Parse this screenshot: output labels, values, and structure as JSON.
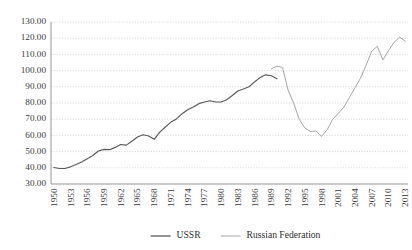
{
  "chart_data": {
    "type": "line",
    "title": "",
    "subtitle": "",
    "xlabel": "",
    "ylabel": "",
    "grid": "horizontal-dotted",
    "legend_position": "bottom-center",
    "ylim": [
      30.0,
      130.0
    ],
    "ystep": 10.0,
    "ytick_labels": [
      "130.00",
      "120.00",
      "110.00",
      "100.00",
      "90.00",
      "80.00",
      "70.00",
      "60.00",
      "50.00",
      "40.00",
      "30.00"
    ],
    "ytick_values": [
      130.0,
      120.0,
      110.0,
      100.0,
      90.0,
      80.0,
      70.0,
      60.0,
      50.0,
      40.0,
      30.0
    ],
    "xlim": [
      1950,
      2013
    ],
    "xtick_labels": [
      "1950",
      "1953",
      "1956",
      "1959",
      "1962",
      "1965",
      "1968",
      "1971",
      "1974",
      "1977",
      "1980",
      "1983",
      "1986",
      "1989",
      "1992",
      "1995",
      "1998",
      "2001",
      "2004",
      "2007",
      "2010",
      "2013"
    ],
    "xtick_values": [
      1950,
      1953,
      1956,
      1959,
      1962,
      1965,
      1968,
      1971,
      1974,
      1977,
      1980,
      1983,
      1986,
      1989,
      1992,
      1995,
      1998,
      2001,
      2004,
      2007,
      2010,
      2013
    ],
    "series": [
      {
        "name": "USSR",
        "color": "#595959",
        "x": [
          1950,
          1951,
          1952,
          1953,
          1954,
          1955,
          1956,
          1957,
          1958,
          1959,
          1960,
          1961,
          1962,
          1963,
          1964,
          1965,
          1966,
          1967,
          1968,
          1969,
          1970,
          1971,
          1972,
          1973,
          1974,
          1975,
          1976,
          1977,
          1978,
          1979,
          1980,
          1981,
          1982,
          1983,
          1984,
          1985,
          1986,
          1987,
          1988,
          1989,
          1990
        ],
        "values": [
          40.2,
          39.6,
          39.6,
          40.6,
          42.0,
          43.6,
          45.6,
          47.6,
          50.4,
          51.4,
          51.2,
          52.6,
          54.4,
          54.0,
          56.4,
          59.0,
          60.4,
          59.6,
          57.6,
          62.0,
          65.2,
          68.2,
          70.2,
          73.4,
          75.8,
          77.6,
          79.6,
          80.6,
          81.4,
          80.6,
          80.6,
          82.0,
          84.6,
          87.4,
          88.6,
          90.0,
          93.0,
          95.8,
          97.4,
          96.8,
          95.0
        ]
      },
      {
        "name": "Russian Federation",
        "color": "#a6a6a6",
        "x": [
          1989,
          1990,
          1991,
          1992,
          1993,
          1994,
          1995,
          1996,
          1997,
          1998,
          1999,
          2000,
          2001,
          2002,
          2003,
          2004,
          2005,
          2006,
          2007,
          2008,
          2009,
          2010,
          2011,
          2012,
          2013
        ],
        "values": [
          101.0,
          102.8,
          102.0,
          88.0,
          80.0,
          70.0,
          64.6,
          62.4,
          62.8,
          59.4,
          63.4,
          70.0,
          73.6,
          77.4,
          83.4,
          89.4,
          95.4,
          103.4,
          112.0,
          115.0,
          106.6,
          112.4,
          117.4,
          120.6,
          118.2
        ]
      }
    ]
  },
  "legend": {
    "entries": [
      {
        "label": "USSR",
        "color": "#595959",
        "swatch": "line-swatch"
      },
      {
        "label": "Russian Federation",
        "color": "#a6a6a6",
        "swatch": "line-swatch"
      }
    ]
  }
}
